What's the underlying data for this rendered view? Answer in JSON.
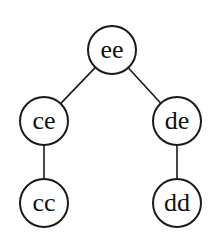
{
  "diagram": {
    "type": "tree",
    "width": 211,
    "height": 240,
    "node_radius": 24,
    "colors": {
      "stroke": "#1a1a1a",
      "fill": "#ffffff",
      "text": "#111111"
    },
    "nodes": [
      {
        "id": "ee",
        "label": "ee",
        "x": 112,
        "y": 50
      },
      {
        "id": "ce",
        "label": "ce",
        "x": 44,
        "y": 121
      },
      {
        "id": "de",
        "label": "de",
        "x": 177,
        "y": 121
      },
      {
        "id": "cc",
        "label": "cc",
        "x": 44,
        "y": 203
      },
      {
        "id": "dd",
        "label": "dd",
        "x": 177,
        "y": 203
      }
    ],
    "edges": [
      {
        "from": "ee",
        "to": "ce"
      },
      {
        "from": "ee",
        "to": "de"
      },
      {
        "from": "ce",
        "to": "cc"
      },
      {
        "from": "de",
        "to": "dd"
      }
    ]
  }
}
